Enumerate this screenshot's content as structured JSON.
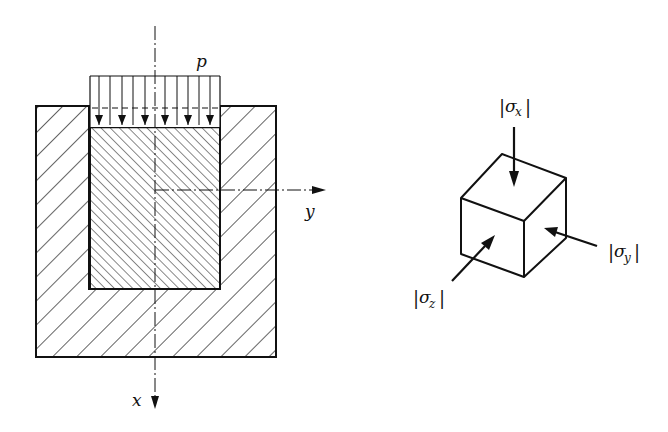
{
  "figure": {
    "left_panel": {
      "description": "Block compressed in a rigid cavity under uniform pressure",
      "load_label": "p",
      "axis_x_label": "x",
      "axis_y_label": "y",
      "load_arrow_count": 6
    },
    "right_panel": {
      "description": "Element cube under triaxial compression",
      "stress_x_label": "σ",
      "stress_x_sub": "x",
      "stress_y_label": "σ",
      "stress_y_sub": "y",
      "stress_z_label": "σ",
      "stress_z_sub": "z",
      "abs_bar": "|"
    }
  },
  "colors": {
    "ink": "#111111",
    "background": "#ffffff"
  }
}
